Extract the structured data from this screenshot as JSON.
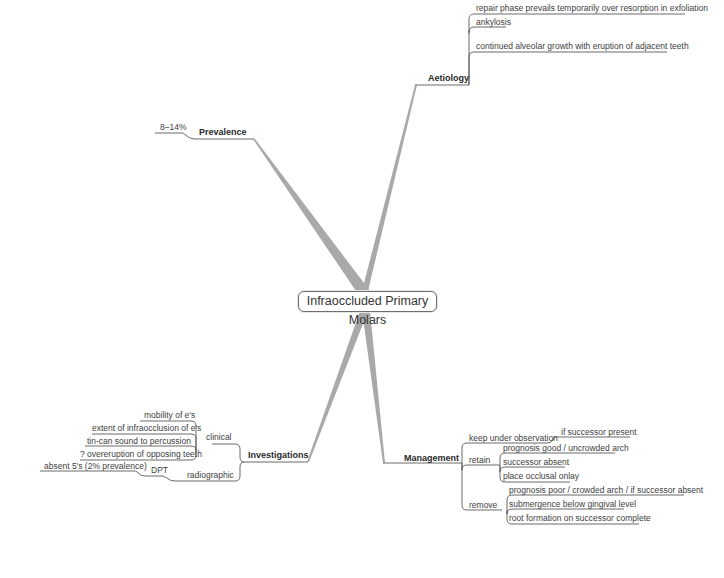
{
  "central_topic": "Infraoccluded Primary Molars",
  "colors": {
    "branch": "#a8a8a8",
    "line": "#555555",
    "text": "#404040"
  },
  "branches": {
    "aetiology": {
      "label": "Aetiology",
      "children": [
        "repair phase prevails temporarily over resorption in exfoliation",
        "ankylosis",
        "continued alveolar growth with eruption of adjacent teeth"
      ]
    },
    "prevalence": {
      "label": "Prevalence",
      "children": [
        "8–14%"
      ]
    },
    "investigations": {
      "label": "Investigations",
      "clinical": {
        "label": "clinical",
        "children": [
          "mobility of e's",
          "extent of infraocclusion of e's",
          "tin-can sound to percussion",
          "? overeruption of opposing teeth"
        ]
      },
      "radiographic": {
        "label": "radiographic",
        "dpt": {
          "label": "DPT",
          "children": [
            "absent 5's (2% prevalence)"
          ]
        }
      }
    },
    "management": {
      "label": "Management",
      "keep": {
        "label": "keep under observation",
        "children": [
          "if successor present"
        ]
      },
      "retain": {
        "label": "retain",
        "children": [
          "prognosis good / uncrowded arch",
          "successor absent",
          "place occlusal onlay"
        ]
      },
      "remove": {
        "label": "remove",
        "children": [
          "prognosis poor / crowded arch / if successor absent",
          "submergence below gingival level",
          "root formation on successor complete"
        ]
      }
    }
  }
}
